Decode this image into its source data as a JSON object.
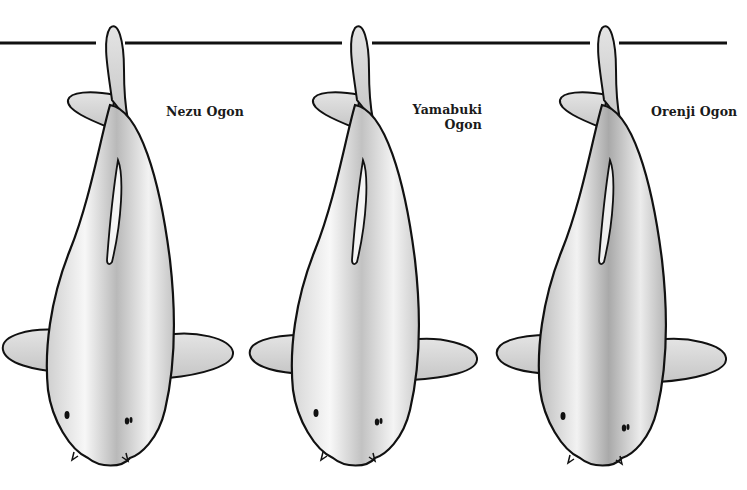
{
  "figure": {
    "rule_color": "#111111",
    "fish": [
      {
        "id": "nezu",
        "label": "Nezu Ogon",
        "label_lines": [
          "Nezu Ogon"
        ],
        "body_light": "#f7f7f7",
        "body_dark": "#b9b9b9",
        "fin": "#d4d4d4"
      },
      {
        "id": "yamabuki",
        "label": "Yamabuki Ogon",
        "label_lines": [
          "Yamabuki",
          "Ogon"
        ],
        "body_light": "#f8f8f8",
        "body_dark": "#c2c2c2",
        "fin": "#dadada"
      },
      {
        "id": "orenji",
        "label": "Orenji Ogon",
        "label_lines": [
          "Orenji Ogon"
        ],
        "body_light": "#f2f2f2",
        "body_dark": "#a9a9a9",
        "fin": "#c8c8c8"
      }
    ]
  }
}
